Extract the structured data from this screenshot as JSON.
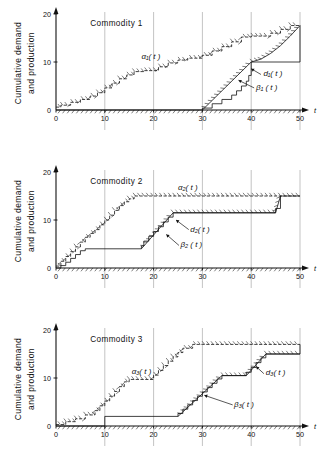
{
  "figure": {
    "y_axis_label": "Cumulative demand\nand  production",
    "x_axis_label": "t"
  },
  "axis": {
    "x_ticks": [
      "0",
      "10",
      "20",
      "30",
      "40",
      "50"
    ],
    "x_tick_values": [
      0,
      10,
      20,
      30,
      40,
      50
    ],
    "y_ticks": [
      "0",
      "10",
      "20"
    ],
    "y_tick_values": [
      0,
      10,
      20
    ],
    "xlim": [
      0,
      50
    ],
    "ylim": [
      0,
      20
    ],
    "gridlines_x": [
      10,
      20,
      30,
      40,
      50
    ]
  },
  "chart_data": [
    {
      "type": "line",
      "title": "Commodity  1",
      "xlabel": "t",
      "ylabel": "Cumulative demand and  production",
      "xlim": [
        0,
        50
      ],
      "ylim": [
        0,
        20
      ],
      "grid": "vertical",
      "legend": "inline-annotations",
      "annotations": [
        {
          "text": "α₁( t )",
          "x": 17.5,
          "y": 10.6
        },
        {
          "text": "d₁( t )",
          "x": 42.5,
          "y": 7.0
        },
        {
          "text": "β₁ ( t )",
          "x": 41.0,
          "y": 4.2
        }
      ],
      "series": [
        {
          "name": "α₁(t)",
          "kind": "staircase-demand",
          "points": [
            [
              0,
              0.6
            ],
            [
              1,
              0.6
            ],
            [
              1,
              1.0
            ],
            [
              3,
              1.0
            ],
            [
              3,
              1.6
            ],
            [
              5,
              1.6
            ],
            [
              5,
              2.2
            ],
            [
              7,
              2.2
            ],
            [
              7,
              2.9
            ],
            [
              8.5,
              2.9
            ],
            [
              8.5,
              3.6
            ],
            [
              10,
              3.6
            ],
            [
              10,
              4.6
            ],
            [
              11.5,
              4.6
            ],
            [
              11.5,
              5.6
            ],
            [
              13,
              5.6
            ],
            [
              13,
              6.5
            ],
            [
              14.5,
              6.5
            ],
            [
              14.5,
              7.3
            ],
            [
              16,
              7.3
            ],
            [
              16,
              8.0
            ],
            [
              18,
              8.0
            ],
            [
              18,
              8.2
            ],
            [
              21,
              8.2
            ],
            [
              21,
              9.0
            ],
            [
              23,
              9.0
            ],
            [
              23,
              9.8
            ],
            [
              25,
              9.8
            ],
            [
              25,
              10.4
            ],
            [
              27,
              10.4
            ],
            [
              27,
              10.8
            ],
            [
              30,
              10.8
            ],
            [
              30,
              11.4
            ],
            [
              32,
              11.4
            ],
            [
              32,
              12.3
            ],
            [
              34,
              12.3
            ],
            [
              34,
              13.2
            ],
            [
              36,
              13.2
            ],
            [
              36,
              14.2
            ],
            [
              38,
              14.2
            ],
            [
              38,
              15.2
            ],
            [
              40,
              15.2
            ],
            [
              40,
              15.4
            ],
            [
              44,
              15.4
            ],
            [
              44,
              16.0
            ],
            [
              46,
              16.0
            ],
            [
              46,
              16.8
            ],
            [
              48,
              16.8
            ],
            [
              48,
              17.6
            ],
            [
              50,
              17.6
            ]
          ]
        },
        {
          "name": "β₁(t)",
          "kind": "staircase-production",
          "points": [
            [
              0,
              0
            ],
            [
              30,
              0
            ],
            [
              30,
              0.4
            ],
            [
              32,
              0.4
            ],
            [
              32,
              1.3
            ],
            [
              34,
              1.3
            ],
            [
              34,
              2.2
            ],
            [
              36,
              2.2
            ],
            [
              36,
              3.1
            ],
            [
              37,
              3.1
            ],
            [
              37,
              4.0
            ],
            [
              38,
              4.0
            ],
            [
              38,
              5.0
            ],
            [
              39,
              5.0
            ],
            [
              39,
              6.0
            ],
            [
              39.5,
              6.0
            ],
            [
              39.5,
              7.2
            ],
            [
              40,
              7.2
            ],
            [
              40,
              10.0
            ],
            [
              50,
              10.0
            ],
            [
              50,
              17.6
            ]
          ]
        },
        {
          "name": "d₁(t)",
          "kind": "production-envelope",
          "points": [
            [
              30,
              0
            ],
            [
              40,
              10.0
            ],
            [
              40,
              10.0
            ],
            [
              42,
              10.6
            ],
            [
              44,
              11.8
            ],
            [
              46,
              13.4
            ],
            [
              48,
              15.4
            ],
            [
              50,
              17.6
            ]
          ]
        }
      ]
    },
    {
      "type": "line",
      "title": "Commodity  2",
      "xlabel": "t",
      "ylabel": "Cumulative demand and  production",
      "xlim": [
        0,
        50
      ],
      "ylim": [
        0,
        20
      ],
      "grid": "vertical",
      "legend": "inline-annotations",
      "annotations": [
        {
          "text": "α₂( t )",
          "x": 25.0,
          "y": 16.2
        },
        {
          "text": "d₂( t )",
          "x": 27.5,
          "y": 7.6
        },
        {
          "text": "β₂ ( t )",
          "x": 25.5,
          "y": 4.3
        }
      ],
      "series": [
        {
          "name": "α₂(t)",
          "kind": "staircase-demand",
          "points": [
            [
              0,
              0.4
            ],
            [
              1,
              0.4
            ],
            [
              1,
              1.4
            ],
            [
              2,
              1.4
            ],
            [
              2,
              2.4
            ],
            [
              3,
              2.4
            ],
            [
              3,
              3.4
            ],
            [
              4,
              3.4
            ],
            [
              4,
              4.4
            ],
            [
              5,
              4.4
            ],
            [
              5,
              5.4
            ],
            [
              6,
              5.4
            ],
            [
              6,
              6.4
            ],
            [
              7,
              6.4
            ],
            [
              7,
              7.2
            ],
            [
              8,
              7.2
            ],
            [
              8,
              8.0
            ],
            [
              9,
              8.0
            ],
            [
              9,
              9.0
            ],
            [
              10,
              9.0
            ],
            [
              10,
              10.0
            ],
            [
              11,
              10.0
            ],
            [
              11,
              11.0
            ],
            [
              12,
              11.0
            ],
            [
              12,
              12.0
            ],
            [
              13,
              12.0
            ],
            [
              13,
              13.0
            ],
            [
              14,
              13.0
            ],
            [
              14,
              13.8
            ],
            [
              15,
              13.8
            ],
            [
              15,
              14.4
            ],
            [
              16,
              14.4
            ],
            [
              16,
              15.0
            ],
            [
              18,
              15.0
            ],
            [
              50,
              15.0
            ]
          ]
        },
        {
          "name": "β₂(t)",
          "kind": "staircase-production",
          "points": [
            [
              0,
              0
            ],
            [
              1,
              0
            ],
            [
              1,
              0.5
            ],
            [
              2,
              0.5
            ],
            [
              2,
              1.2
            ],
            [
              3,
              1.2
            ],
            [
              3,
              2.0
            ],
            [
              4,
              2.0
            ],
            [
              4,
              2.8
            ],
            [
              5,
              2.8
            ],
            [
              5,
              3.6
            ],
            [
              6,
              3.6
            ],
            [
              6,
              4.0
            ],
            [
              17.5,
              4.0
            ],
            [
              17.5,
              4.6
            ],
            [
              18,
              4.6
            ],
            [
              18,
              5.6
            ],
            [
              19,
              5.6
            ],
            [
              19,
              6.6
            ],
            [
              20,
              6.6
            ],
            [
              20,
              7.6
            ],
            [
              21,
              7.6
            ],
            [
              21,
              8.6
            ],
            [
              22,
              8.6
            ],
            [
              22,
              9.6
            ],
            [
              23,
              9.6
            ],
            [
              23,
              10.6
            ],
            [
              24,
              10.6
            ],
            [
              24,
              11.5
            ],
            [
              45,
              11.5
            ],
            [
              45,
              12.4
            ],
            [
              46,
              12.4
            ],
            [
              46,
              15.0
            ],
            [
              50,
              15.0
            ]
          ]
        },
        {
          "name": "d₂(t)",
          "kind": "production-envelope",
          "points": [
            [
              17.5,
              4.0
            ],
            [
              24,
              11.5
            ],
            [
              45,
              11.5
            ],
            [
              46,
              15.0
            ]
          ]
        }
      ]
    },
    {
      "type": "line",
      "title": "Commodity  3",
      "xlabel": "t",
      "ylabel": "Cumulative demand and  production",
      "xlim": [
        0,
        50
      ],
      "ylim": [
        0,
        20
      ],
      "grid": "vertical",
      "legend": "inline-annotations",
      "annotations": [
        {
          "text": "α₃( t )",
          "x": 15.5,
          "y": 10.8
        },
        {
          "text": "d₃( t )",
          "x": 43.0,
          "y": 10.6
        },
        {
          "text": "β₃( t )",
          "x": 36.5,
          "y": 4.0
        }
      ],
      "series": [
        {
          "name": "α₃(t)",
          "kind": "staircase-demand",
          "points": [
            [
              0,
              0.3
            ],
            [
              2,
              0.3
            ],
            [
              2,
              0.9
            ],
            [
              4,
              0.9
            ],
            [
              4,
              1.5
            ],
            [
              6,
              1.5
            ],
            [
              6,
              2.3
            ],
            [
              8,
              2.3
            ],
            [
              8,
              3.2
            ],
            [
              9,
              3.2
            ],
            [
              9,
              4.2
            ],
            [
              10,
              4.2
            ],
            [
              10,
              5.2
            ],
            [
              11,
              5.2
            ],
            [
              11,
              6.2
            ],
            [
              12,
              6.2
            ],
            [
              12,
              7.2
            ],
            [
              13,
              7.2
            ],
            [
              13,
              8.2
            ],
            [
              14,
              8.2
            ],
            [
              14,
              9.2
            ],
            [
              15,
              9.2
            ],
            [
              15,
              9.7
            ],
            [
              20,
              9.7
            ],
            [
              20,
              10.6
            ],
            [
              21,
              10.6
            ],
            [
              21,
              11.6
            ],
            [
              22,
              11.6
            ],
            [
              22,
              12.6
            ],
            [
              23,
              12.6
            ],
            [
              23,
              13.5
            ],
            [
              24,
              13.5
            ],
            [
              24,
              14.4
            ],
            [
              25,
              14.4
            ],
            [
              25,
              15.3
            ],
            [
              26,
              15.3
            ],
            [
              26,
              16.2
            ],
            [
              28,
              16.2
            ],
            [
              28,
              17.0
            ],
            [
              30,
              17.0
            ],
            [
              50,
              17.0
            ]
          ]
        },
        {
          "name": "β₃(t)",
          "kind": "staircase-production",
          "points": [
            [
              0,
              0
            ],
            [
              10,
              0
            ],
            [
              10,
              2.0
            ],
            [
              25,
              2.0
            ],
            [
              25,
              2.6
            ],
            [
              26,
              2.6
            ],
            [
              26,
              3.5
            ],
            [
              27,
              3.5
            ],
            [
              27,
              4.4
            ],
            [
              28,
              4.4
            ],
            [
              28,
              5.3
            ],
            [
              29,
              5.3
            ],
            [
              29,
              6.2
            ],
            [
              30,
              6.2
            ],
            [
              30,
              7.1
            ],
            [
              31,
              7.1
            ],
            [
              31,
              8.0
            ],
            [
              32,
              8.0
            ],
            [
              32,
              8.9
            ],
            [
              33,
              8.9
            ],
            [
              33,
              9.8
            ],
            [
              34,
              9.8
            ],
            [
              34,
              10.5
            ],
            [
              39,
              10.5
            ],
            [
              39,
              11.2
            ],
            [
              40,
              11.2
            ],
            [
              40,
              12.2
            ],
            [
              41,
              12.2
            ],
            [
              41,
              13.2
            ],
            [
              42,
              13.2
            ],
            [
              42,
              14.2
            ],
            [
              43,
              14.2
            ],
            [
              43,
              15.0
            ],
            [
              50,
              15.0
            ],
            [
              50,
              17.0
            ]
          ]
        },
        {
          "name": "d₃(t)",
          "kind": "production-envelope",
          "points": [
            [
              25,
              2.0
            ],
            [
              34,
              10.5
            ],
            [
              39,
              10.5
            ],
            [
              43,
              15.0
            ],
            [
              50,
              15.0
            ]
          ]
        }
      ]
    }
  ]
}
